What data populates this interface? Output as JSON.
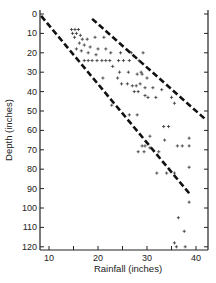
{
  "chart_data": {
    "type": "scatter",
    "title": "",
    "xlabel": "Rainfall (inches)",
    "ylabel": "Depth (inches)",
    "xlim": [
      8,
      42.5
    ],
    "ylim": [
      120,
      0
    ],
    "y_inverted": true,
    "grid": false,
    "legend": null,
    "x_ticks": [
      10,
      20,
      30,
      40
    ],
    "x_minor_ticks": [
      15,
      25,
      35
    ],
    "y_ticks": [
      0,
      10,
      20,
      30,
      40,
      50,
      60,
      70,
      80,
      90,
      100,
      110,
      120
    ],
    "marker": "+",
    "series": [
      {
        "name": "observations",
        "points": [
          [
            14.6,
            8
          ],
          [
            15.3,
            8
          ],
          [
            16.0,
            8
          ],
          [
            14.8,
            10
          ],
          [
            15.6,
            10
          ],
          [
            16.4,
            11
          ],
          [
            15.2,
            12
          ],
          [
            16.8,
            13
          ],
          [
            17.8,
            13
          ],
          [
            19.4,
            12
          ],
          [
            21.2,
            12
          ],
          [
            16.2,
            15
          ],
          [
            17.2,
            16
          ],
          [
            18.4,
            17
          ],
          [
            20.0,
            18
          ],
          [
            21.6,
            18
          ],
          [
            15.6,
            18
          ],
          [
            16.6,
            19
          ],
          [
            18.0,
            20
          ],
          [
            19.6,
            21
          ],
          [
            22.6,
            20
          ],
          [
            24.6,
            20
          ],
          [
            26.8,
            20
          ],
          [
            29.2,
            20
          ],
          [
            17.2,
            24
          ],
          [
            18.0,
            24
          ],
          [
            18.8,
            24
          ],
          [
            19.8,
            24
          ],
          [
            20.8,
            24
          ],
          [
            21.6,
            24
          ],
          [
            22.4,
            24
          ],
          [
            24.2,
            24
          ],
          [
            25.2,
            24
          ],
          [
            26.4,
            24
          ],
          [
            28.4,
            24
          ],
          [
            23.0,
            27
          ],
          [
            24.4,
            30
          ],
          [
            26.2,
            30
          ],
          [
            28.8,
            30
          ],
          [
            21.0,
            33
          ],
          [
            24.0,
            33
          ],
          [
            28.0,
            31
          ],
          [
            29.0,
            31
          ],
          [
            30.0,
            33
          ],
          [
            24.8,
            36
          ],
          [
            26.0,
            36
          ],
          [
            27.0,
            37
          ],
          [
            27.8,
            37
          ],
          [
            28.6,
            36
          ],
          [
            29.6,
            38
          ],
          [
            31.2,
            38
          ],
          [
            33.0,
            39
          ],
          [
            27.4,
            40
          ],
          [
            28.2,
            40
          ],
          [
            29.6,
            42
          ],
          [
            30.2,
            43
          ],
          [
            31.8,
            43
          ],
          [
            35.0,
            43
          ],
          [
            35.6,
            46
          ],
          [
            22.8,
            47
          ],
          [
            28.0,
            52
          ],
          [
            33.4,
            58
          ],
          [
            34.4,
            58
          ],
          [
            26.4,
            52
          ],
          [
            30.6,
            63
          ],
          [
            33.6,
            65
          ],
          [
            29.6,
            68
          ],
          [
            29.0,
            68
          ],
          [
            30.6,
            69
          ],
          [
            36.2,
            68
          ],
          [
            37.2,
            68
          ],
          [
            38.6,
            68
          ],
          [
            28.2,
            71
          ],
          [
            29.4,
            71
          ],
          [
            32.4,
            71
          ],
          [
            38.6,
            64
          ],
          [
            32.0,
            82
          ],
          [
            34.0,
            82
          ],
          [
            35.6,
            82
          ],
          [
            38.6,
            79
          ],
          [
            38.6,
            97
          ],
          [
            36.4,
            105
          ],
          [
            37.6,
            112
          ],
          [
            35.6,
            118
          ],
          [
            36.0,
            120
          ],
          [
            37.8,
            120
          ]
        ]
      }
    ],
    "annotations": [
      {
        "type": "dashed-line",
        "name": "lower-envelope",
        "from": [
          8.4,
          1
        ],
        "to": [
          38.8,
          93
        ]
      },
      {
        "type": "dashed-line",
        "name": "upper-envelope",
        "from": [
          18.8,
          2.5
        ],
        "to": [
          41.8,
          54
        ]
      }
    ]
  },
  "axes": {
    "x_title": "Rainfall (inches)",
    "y_title": "Depth (inches)",
    "x_tick_labels": [
      "10",
      "20",
      "30",
      "40"
    ],
    "y_tick_labels": [
      "0",
      "10",
      "20",
      "30",
      "40",
      "50",
      "60",
      "70",
      "80",
      "90",
      "100",
      "110",
      "120"
    ]
  }
}
